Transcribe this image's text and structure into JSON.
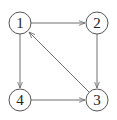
{
  "diagram": {
    "type": "directed-graph",
    "nodes": [
      {
        "id": "1",
        "label": "1",
        "x": 20,
        "y": 23
      },
      {
        "id": "2",
        "label": "2",
        "x": 97,
        "y": 23
      },
      {
        "id": "3",
        "label": "3",
        "x": 97,
        "y": 100
      },
      {
        "id": "4",
        "label": "4",
        "x": 20,
        "y": 100
      }
    ],
    "edges": [
      {
        "from": "1",
        "to": "2"
      },
      {
        "from": "2",
        "to": "3"
      },
      {
        "from": "1",
        "to": "4"
      },
      {
        "from": "4",
        "to": "3"
      },
      {
        "from": "3",
        "to": "1"
      }
    ],
    "colors": {
      "node_stroke": "#555555",
      "edge_stroke": "#6e6e6e",
      "label": "#222222",
      "background": "#ffffff"
    }
  }
}
